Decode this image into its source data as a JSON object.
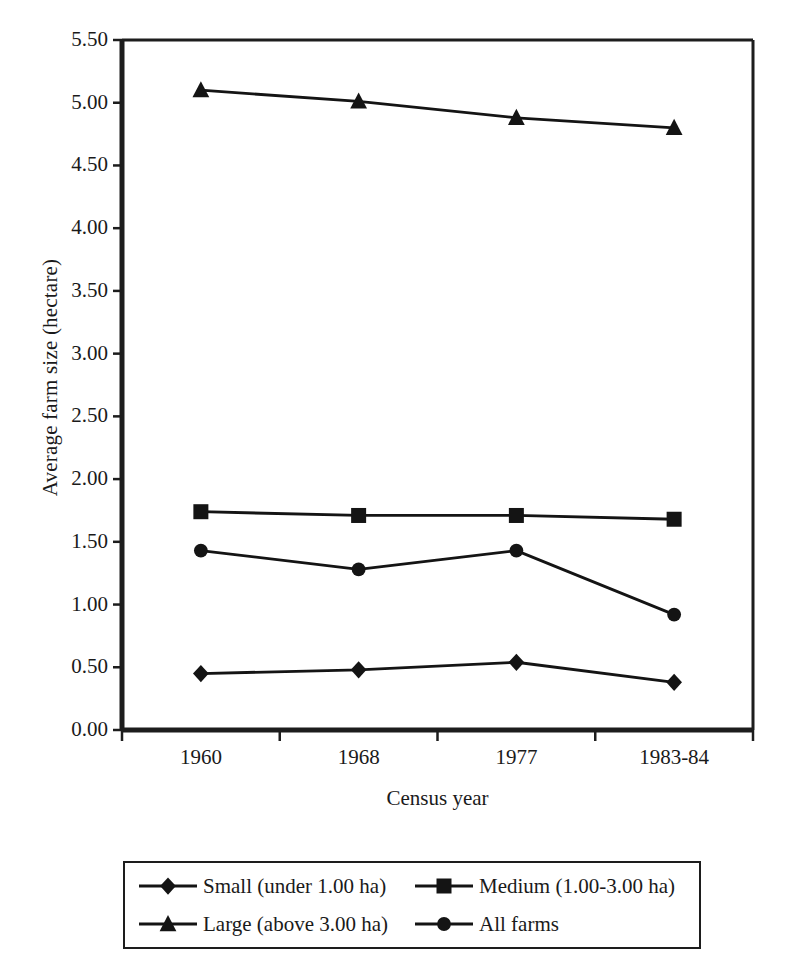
{
  "chart_data": {
    "type": "line",
    "title": "",
    "xlabel": "Census year",
    "ylabel": "Average farm size (hectare)",
    "categories": [
      "1960",
      "1968",
      "1977",
      "1983-84"
    ],
    "ylim": [
      0.0,
      5.5
    ],
    "y_tick_step": 0.5,
    "y_ticks": [
      "0.00",
      "0.50",
      "1.00",
      "1.50",
      "2.00",
      "2.50",
      "3.00",
      "3.50",
      "4.00",
      "4.50",
      "5.00",
      "5.50"
    ],
    "grid": false,
    "legend_position": "bottom",
    "series": [
      {
        "name": "Small (under 1.00 ha)",
        "marker": "diamond",
        "color": "#141414",
        "values": [
          0.45,
          0.48,
          0.54,
          0.38
        ]
      },
      {
        "name": "Medium (1.00-3.00 ha)",
        "marker": "square",
        "color": "#141414",
        "values": [
          1.74,
          1.71,
          1.71,
          1.68
        ]
      },
      {
        "name": "Large (above 3.00 ha)",
        "marker": "triangle",
        "color": "#141414",
        "values": [
          5.1,
          5.01,
          4.88,
          4.8
        ]
      },
      {
        "name": "All farms",
        "marker": "circle",
        "color": "#141414",
        "values": [
          1.43,
          1.28,
          1.43,
          0.92
        ]
      }
    ]
  },
  "legend": {
    "entries": [
      {
        "label": "Small (under 1.00 ha)",
        "marker": "diamond-marker-icon"
      },
      {
        "label": "Medium (1.00-3.00 ha)",
        "marker": "square-marker-icon"
      },
      {
        "label": "Large (above 3.00 ha)",
        "marker": "triangle-marker-icon"
      },
      {
        "label": "All farms",
        "marker": "circle-marker-icon"
      }
    ]
  },
  "style": {
    "axis_color": "#1d1d1d",
    "plot_background": "#ffffff",
    "series_color": "#141414"
  }
}
